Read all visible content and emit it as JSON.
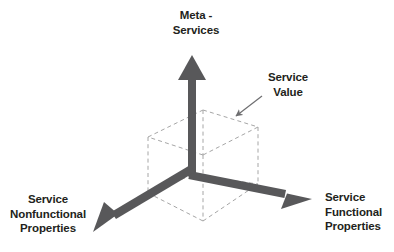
{
  "figure": {
    "background_color": "#ffffff",
    "axis_color": "#58585a",
    "cube_color": "#a6a6a6",
    "leader_color": "#6e6e70",
    "text_color": "#231f20"
  },
  "labels": {
    "meta_services": {
      "line1": "Meta -",
      "line2": "Services",
      "icon": "axis-label-vertical"
    },
    "service_value": {
      "line1": "Service",
      "line2": "Value",
      "icon": "callout-label"
    },
    "service_nonfunctional": {
      "line1": "Service",
      "line2": "Nonfunctional",
      "line3": "Properties",
      "icon": "axis-label-left"
    },
    "service_functional": {
      "line1": "Service",
      "line2": "Functional",
      "line3": "Properties",
      "icon": "axis-label-right"
    }
  },
  "axes": [
    {
      "name": "meta-services-axis",
      "direction": "up",
      "from": [
        192,
        175
      ],
      "to": [
        192,
        62
      ],
      "arrowhead": true
    },
    {
      "name": "service-nonfunctional-axis",
      "direction": "down-left",
      "from": [
        192,
        175
      ],
      "to": [
        103,
        226
      ],
      "arrowhead": true
    },
    {
      "name": "service-functional-axis",
      "direction": "down-right",
      "from": [
        192,
        175
      ],
      "to": [
        300,
        197
      ],
      "arrowhead": true
    }
  ],
  "cube": {
    "name": "service-value-cube",
    "style": "dashed",
    "vertices": {
      "top_left": [
        148,
        137
      ],
      "top_back": [
        203,
        110
      ],
      "top_right": [
        258,
        127
      ],
      "top_front": [
        203,
        155
      ],
      "bottom_left": [
        148,
        193
      ],
      "bottom_front": [
        203,
        221
      ],
      "bottom_right": [
        258,
        184
      ],
      "bottom_back": [
        203,
        165
      ]
    }
  },
  "callout": {
    "name": "service-value-leader",
    "from": [
      262,
      96
    ],
    "to": [
      233,
      118
    ]
  }
}
